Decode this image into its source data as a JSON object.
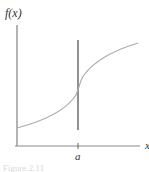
{
  "figure": {
    "y_axis_label": "f(x)",
    "x_axis_label": "x",
    "tick_label": "a",
    "caption": "Figure 2.11"
  },
  "colors": {
    "axis": "#555555",
    "curve": "#aaaaaa",
    "vertical_line": "#555555",
    "text": "#333333",
    "background": "#ffffff"
  }
}
